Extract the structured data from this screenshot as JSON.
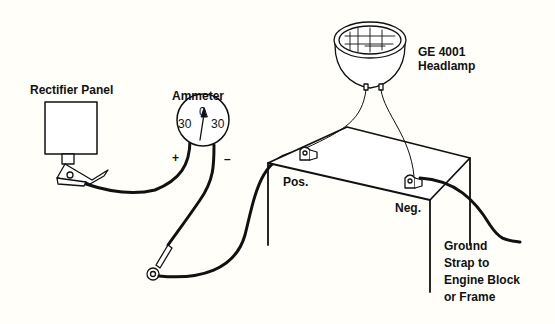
{
  "labels": {
    "rectifier_panel": "Rectifier Panel",
    "ammeter": "Ammeter",
    "ammeter_scale_left": "30",
    "ammeter_scale_zero": "0",
    "ammeter_scale_right": "30",
    "plus": "+",
    "minus": "–",
    "headlamp_line1": "GE 4001",
    "headlamp_line2": "Headlamp",
    "pos": "Pos.",
    "neg": "Neg.",
    "ground_line1": "Ground",
    "ground_line2": "Strap to",
    "ground_line3": "Engine Block",
    "ground_line4": "or Frame"
  },
  "colors": {
    "background": "#fffef8",
    "ink": "#111111"
  }
}
